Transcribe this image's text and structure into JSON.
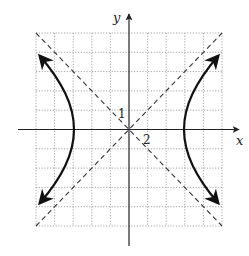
{
  "diagram": {
    "type": "hyperbola-graph",
    "axes": {
      "x_label": "x",
      "y_label": "y"
    },
    "tick_labels": {
      "y_first_tick": "1",
      "x_first_tick": "2"
    },
    "grid": {
      "cells_x": 10,
      "cells_y": 10,
      "x_units_per_cell": 2,
      "y_units_per_cell": 1,
      "style": "dotted"
    },
    "curve": {
      "equation": "x^2/36 - y^2/9 = 1",
      "vertices": [
        [
          -6,
          0
        ],
        [
          6,
          0
        ]
      ],
      "asymptotes": [
        "y = x/2",
        "y = -x/2"
      ],
      "asymptote_style": "dashed"
    },
    "colors": {
      "curve": "#111111",
      "axes": "#222222",
      "grid": "#9a9a9a",
      "asymptote": "#333333"
    }
  }
}
